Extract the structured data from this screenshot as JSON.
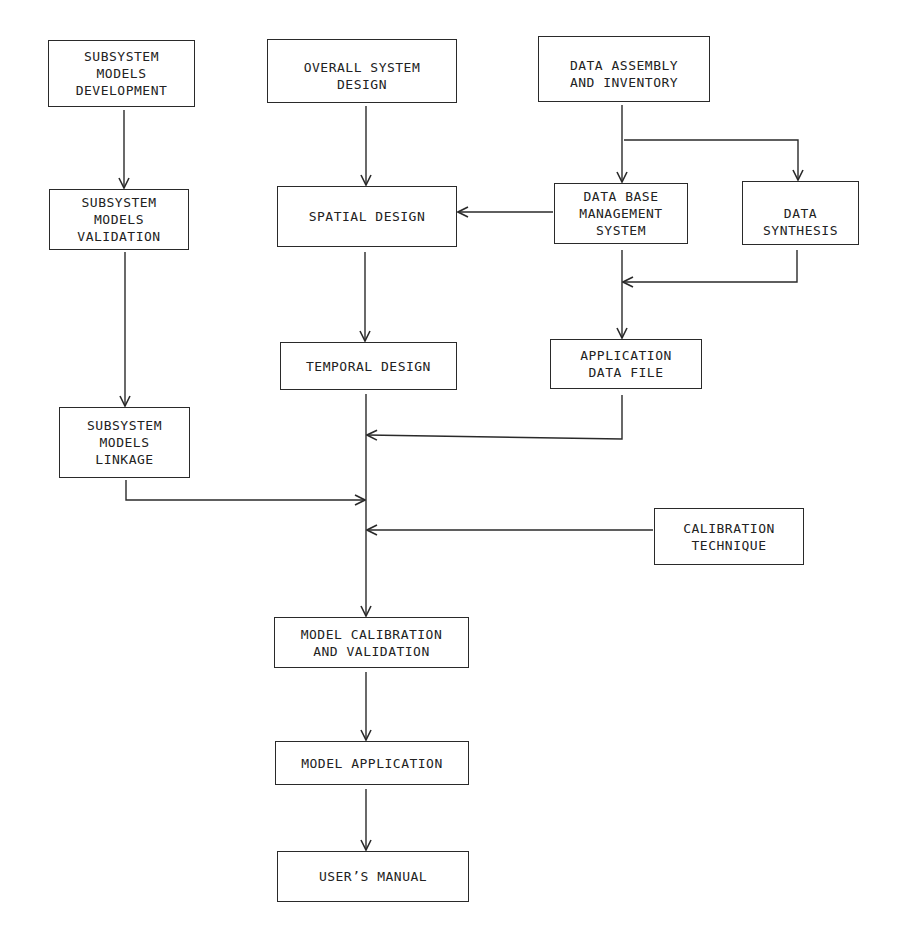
{
  "diagram": {
    "line_color": "#2a2a2a",
    "boxes": {
      "subsystem_dev": "SUBSYSTEM\nMODELS\nDEVELOPMENT",
      "overall_design": "OVERALL SYSTEM\nDESIGN",
      "data_assembly": "DATA ASSEMBLY\nAND INVENTORY",
      "subsystem_validation": "SUBSYSTEM\nMODELS\nVALIDATION",
      "spatial_design": "SPATIAL DESIGN",
      "dbms": "DATA BASE\nMANAGEMENT\nSYSTEM",
      "data_synthesis": "DATA\nSYNTHESIS",
      "temporal_design": "TEMPORAL DESIGN",
      "app_data_file": "APPLICATION\nDATA FILE",
      "subsystem_linkage": "SUBSYSTEM\nMODELS\nLINKAGE",
      "calibration_technique": "CALIBRATION\nTECHNIQUE",
      "model_calibration": "MODEL CALIBRATION\nAND VALIDATION",
      "model_application": "MODEL APPLICATION",
      "users_manual": "USER’S MANUAL"
    },
    "edges": [
      {
        "from": "SUBSYSTEM MODELS DEVELOPMENT",
        "to": "SUBSYSTEM MODELS VALIDATION"
      },
      {
        "from": "SUBSYSTEM MODELS VALIDATION",
        "to": "SUBSYSTEM MODELS LINKAGE"
      },
      {
        "from": "OVERALL SYSTEM DESIGN",
        "to": "SPATIAL DESIGN"
      },
      {
        "from": "DATA ASSEMBLY AND INVENTORY",
        "to": "DATA BASE MANAGEMENT SYSTEM"
      },
      {
        "from": "DATA ASSEMBLY AND INVENTORY",
        "to": "DATA SYNTHESIS"
      },
      {
        "from": "DATA BASE MANAGEMENT SYSTEM",
        "to": "SPATIAL DESIGN"
      },
      {
        "from": "SPATIAL DESIGN",
        "to": "TEMPORAL DESIGN"
      },
      {
        "from": "DATA BASE MANAGEMENT SYSTEM",
        "to": "APPLICATION DATA FILE"
      },
      {
        "from": "DATA SYNTHESIS",
        "to": "APPLICATION DATA FILE"
      },
      {
        "from": "TEMPORAL DESIGN",
        "to": "MODEL CALIBRATION AND VALIDATION"
      },
      {
        "from": "APPLICATION DATA FILE",
        "to": "MODEL CALIBRATION AND VALIDATION"
      },
      {
        "from": "SUBSYSTEM MODELS LINKAGE",
        "to": "MODEL CALIBRATION AND VALIDATION"
      },
      {
        "from": "CALIBRATION TECHNIQUE",
        "to": "MODEL CALIBRATION AND VALIDATION"
      },
      {
        "from": "MODEL CALIBRATION AND VALIDATION",
        "to": "MODEL APPLICATION"
      },
      {
        "from": "MODEL APPLICATION",
        "to": "USER'S MANUAL"
      }
    ]
  }
}
